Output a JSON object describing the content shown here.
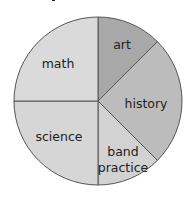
{
  "chart_data": {
    "type": "pie",
    "title": "",
    "categories": [
      "art",
      "history",
      "band practice",
      "science",
      "math"
    ],
    "values": [
      12.5,
      25,
      12.5,
      25,
      25
    ],
    "colors": [
      "#a8a8a8",
      "#bcbcbc",
      "#d2d2d2",
      "#d6d6d6",
      "#dadada"
    ],
    "start_angle_deg": 90,
    "direction": "clockwise",
    "legend": "none (labels inside slices)"
  },
  "labels": {
    "art": "art",
    "history": "history",
    "band_line1": "band",
    "band_line2": "practice",
    "science": "science",
    "math": "math"
  }
}
